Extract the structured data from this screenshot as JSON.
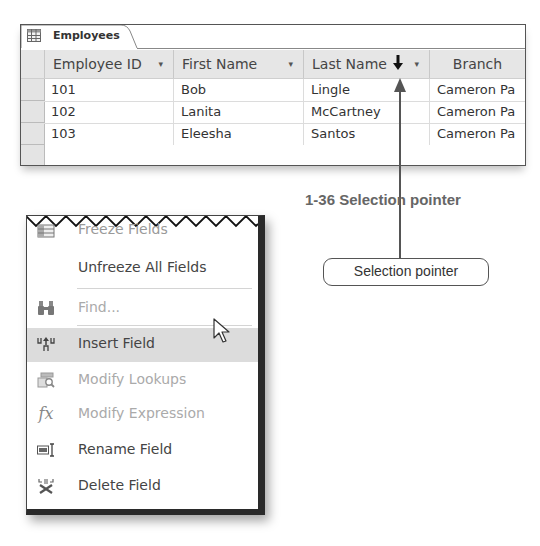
{
  "datasheet": {
    "tab_label": "Employees",
    "tab_icon": "table-icon",
    "columns": [
      {
        "label": "Employee ID",
        "dropdown": "▾"
      },
      {
        "label": "First Name",
        "dropdown": "▾"
      },
      {
        "label": "Last Name",
        "dropdown": "▾"
      },
      {
        "label": "Branch"
      }
    ],
    "rows": [
      [
        "101",
        "Bob",
        "Lingle",
        "Cameron Pa"
      ],
      [
        "102",
        "Lanita",
        "McCartney",
        "Cameron Pa"
      ],
      [
        "103",
        "Eleesha",
        "Santos",
        "Cameron Pa"
      ]
    ]
  },
  "figure": {
    "caption": "1-36  Selection pointer",
    "callout_label": "Selection pointer",
    "pointer_icon": "selection-pointer-down-arrow"
  },
  "context_menu": {
    "items": [
      {
        "label": "Freeze Fields",
        "icon": "freeze-fields-icon",
        "state": "cut-off"
      },
      {
        "label": "Unfreeze All Fields",
        "icon": "",
        "state": "enabled"
      },
      {
        "label": "Find...",
        "icon": "binoculars-icon",
        "state": "disabled"
      },
      {
        "label": "Insert Field",
        "icon": "insert-field-icon",
        "state": "highlighted"
      },
      {
        "label": "Modify Lookups",
        "icon": "modify-lookups-icon",
        "state": "disabled"
      },
      {
        "label": "Modify Expression",
        "icon": "fx-icon",
        "state": "disabled"
      },
      {
        "label": "Rename Field",
        "icon": "rename-field-icon",
        "state": "enabled"
      },
      {
        "label": "Delete Field",
        "icon": "delete-field-icon",
        "state": "enabled"
      }
    ],
    "fx_glyph": "fx"
  }
}
